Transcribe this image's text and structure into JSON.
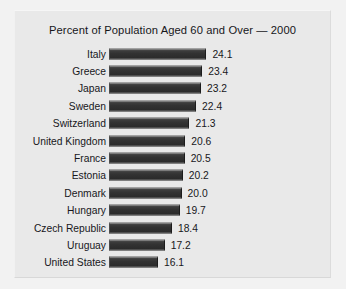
{
  "chart_data": {
    "type": "bar",
    "orientation": "horizontal",
    "title": "Percent of Population Aged 60 and Over — 2000",
    "xlabel": "",
    "ylabel": "",
    "grid": false,
    "legend": "none",
    "axis_note": "truncated value axis; bars begin near 8 percent",
    "axis_baseline": 8,
    "xlim": [
      8,
      32
    ],
    "categories": [
      "Italy",
      "Greece",
      "Japan",
      "Sweden",
      "Switzerland",
      "United Kingdom",
      "France",
      "Estonia",
      "Denmark",
      "Hungary",
      "Czech Republic",
      "Uruguay",
      "United States"
    ],
    "values": [
      24.1,
      23.4,
      23.2,
      22.4,
      21.3,
      20.6,
      20.5,
      20.2,
      20.0,
      19.7,
      18.4,
      17.2,
      16.1
    ],
    "value_labels": [
      "24.1",
      "23.4",
      "23.2",
      "22.4",
      "21.3",
      "20.6",
      "20.5",
      "20.2",
      "20.0",
      "19.7",
      "18.4",
      "17.2",
      "16.1"
    ]
  },
  "colors": {
    "page_background": "#f2f2f2",
    "panel_background": "#e9e9e9",
    "bar_fill": "#323232",
    "text": "#17171b"
  }
}
